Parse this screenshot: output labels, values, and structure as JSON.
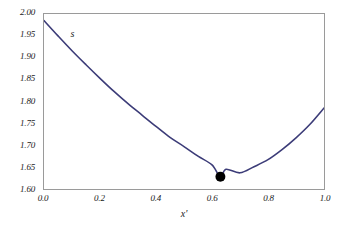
{
  "chart_data": {
    "type": "line",
    "title": "",
    "subtitle": "",
    "xlabel": "x'",
    "ylabel": "",
    "xlim": [
      0.0,
      1.0
    ],
    "ylim": [
      1.6,
      2.0
    ],
    "grid": false,
    "legend": null,
    "xticks": [
      "0.0",
      "0.2",
      "0.4",
      "0.6",
      "0.8",
      "1.0"
    ],
    "xtick_values": [
      0.0,
      0.2,
      0.4,
      0.6,
      0.8,
      1.0
    ],
    "yticks": [
      "1.60",
      "1.65",
      "1.70",
      "1.75",
      "1.80",
      "1.85",
      "1.90",
      "1.95",
      "2.00"
    ],
    "ytick_values": [
      1.6,
      1.65,
      1.7,
      1.75,
      1.8,
      1.85,
      1.9,
      1.95,
      2.0
    ],
    "series": [
      {
        "name": "s",
        "color": "#3c3c78",
        "x": [
          0.0,
          0.05,
          0.1,
          0.15,
          0.2,
          0.25,
          0.3,
          0.35,
          0.4,
          0.45,
          0.5,
          0.55,
          0.6,
          0.63,
          0.65,
          0.7,
          0.75,
          0.8,
          0.85,
          0.9,
          0.95,
          1.0
        ],
        "values": [
          1.985,
          1.95,
          1.916,
          1.884,
          1.853,
          1.823,
          1.795,
          1.769,
          1.743,
          1.718,
          1.697,
          1.675,
          1.655,
          1.628,
          1.645,
          1.637,
          1.651,
          1.667,
          1.69,
          1.717,
          1.748,
          1.785
        ]
      }
    ],
    "annotations": [
      {
        "name": "curve-label",
        "text": "s",
        "x": 0.105,
        "y": 1.955
      }
    ],
    "markers": [
      {
        "name": "minimum-point",
        "x": 0.63,
        "y": 1.628,
        "color": "#000000",
        "shape": "circle",
        "size": 5
      }
    ],
    "colors": {
      "curve": "#3c3c78",
      "marker": "#000000",
      "frame": "#9a9a9a",
      "background": "#ffffff",
      "text": "#1a1a1a"
    }
  }
}
